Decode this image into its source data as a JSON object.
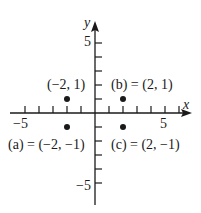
{
  "diagram": {
    "type": "coordinate-plane",
    "axes": {
      "x_label": "x",
      "y_label": "y",
      "x_range": [
        -6,
        6
      ],
      "y_range": [
        -6,
        6
      ],
      "x_tick_labels": [
        {
          "value": -5,
          "text": "−5"
        },
        {
          "value": 5,
          "text": "5"
        }
      ],
      "y_tick_labels": [
        {
          "value": 5,
          "text": "5"
        },
        {
          "value": -5,
          "text": "−5"
        }
      ]
    },
    "points": [
      {
        "name": "point-neg2-1",
        "x": -2,
        "y": 1,
        "label": "(−2, 1)"
      },
      {
        "name": "point-b",
        "x": 2,
        "y": 1,
        "label": "(b) = (2, 1)"
      },
      {
        "name": "point-a",
        "x": -2,
        "y": -1,
        "label": "(a) = (−2, −1)"
      },
      {
        "name": "point-c",
        "x": 2,
        "y": -1,
        "label": "(c) = (2, −1)"
      }
    ],
    "colors": {
      "ink": "#1a1a1a",
      "background": "#ffffff"
    }
  }
}
